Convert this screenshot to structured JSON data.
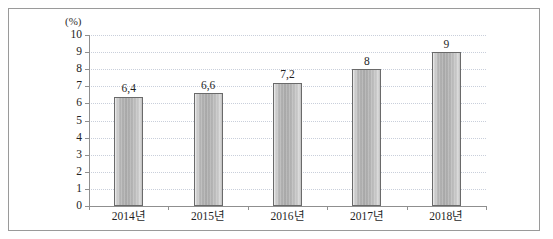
{
  "chart_data": {
    "type": "bar",
    "title": "",
    "subtitle": "",
    "xlabel": "",
    "ylabel": "",
    "unit_label": "(%)",
    "categories": [
      "2014년",
      "2015년",
      "2016년",
      "2017년",
      "2018년"
    ],
    "values": [
      6.4,
      6.6,
      7.2,
      8,
      9
    ],
    "value_labels": [
      "6,4",
      "6,6",
      "7,2",
      "8",
      "9"
    ],
    "ylim": [
      0,
      10
    ],
    "y_ticks": [
      0,
      1,
      2,
      3,
      4,
      5,
      6,
      7,
      8,
      9,
      10
    ],
    "y_tick_labels": [
      "0",
      "1",
      "2",
      "3",
      "4",
      "5",
      "6",
      "7",
      "8",
      "9",
      "10"
    ],
    "grid": true,
    "grid_axis": "y",
    "legend": false,
    "legend_position": "none",
    "series": [
      {
        "name": "",
        "values": [
          6.4,
          6.6,
          7.2,
          8,
          9
        ]
      }
    ],
    "colors": {
      "bar_fill_light": "#e9e9e9",
      "bar_fill_mid": "#ababab",
      "bar_fill_dark": "#b6b6b6",
      "bar_border": "#6a6a6a",
      "gridline": "#c9cfdb",
      "axis": "#8f8f8f",
      "frame_border": "#9a9a9a",
      "text": "#1f1f1f",
      "background": "#ffffff"
    }
  }
}
